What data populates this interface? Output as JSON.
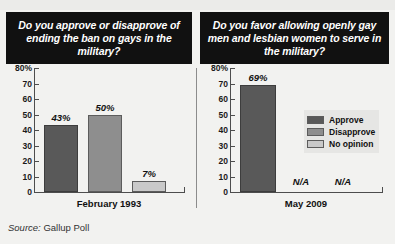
{
  "chart_data": [
    {
      "type": "bar",
      "title": "Do you approve or disapprove of ending the ban on gays in the military?",
      "xlabel": "February 1993",
      "ylabel": "",
      "categories": [
        "Approve",
        "Disapprove",
        "No opinion"
      ],
      "values": [
        43,
        50,
        7
      ],
      "value_labels": [
        "43%",
        "50%",
        "7%"
      ],
      "ylim": [
        0,
        80
      ],
      "yticks": [
        "80%",
        "70",
        "60",
        "50",
        "40",
        "30",
        "20",
        "10",
        "0"
      ],
      "ytick_values": [
        80,
        70,
        60,
        50,
        40,
        30,
        20,
        10,
        0
      ],
      "grid": false,
      "legend_position": "none"
    },
    {
      "type": "bar",
      "title": "Do you favor allowing openly gay men and lesbian women to serve in the military?",
      "xlabel": "May 2009",
      "ylabel": "",
      "categories": [
        "Approve",
        "Disapprove",
        "No opinion"
      ],
      "values": [
        69,
        null,
        null
      ],
      "value_labels": [
        "69%",
        "N/A",
        "N/A"
      ],
      "ylim": [
        0,
        80
      ],
      "yticks": [
        "80%",
        "70",
        "60",
        "50",
        "40",
        "30",
        "20",
        "10",
        "0"
      ],
      "ytick_values": [
        80,
        70,
        60,
        50,
        40,
        30,
        20,
        10,
        0
      ],
      "grid": false,
      "legend_position": "right",
      "legend": [
        {
          "label": "Approve",
          "color": "#595959"
        },
        {
          "label": "Disapprove",
          "color": "#8e8e8e"
        },
        {
          "label": "No opinion",
          "color": "#c9c9c9"
        }
      ]
    }
  ],
  "headers": {
    "left": "Do you approve or disapprove of ending the ban on gays in the military?",
    "right": "Do you favor allowing openly gay men and lesbian women to serve in the military?"
  },
  "source": {
    "label": "Source:",
    "value": "Gallup Poll"
  },
  "colors": {
    "approve": "#595959",
    "disapprove": "#8e8e8e",
    "no_opinion": "#c9c9c9",
    "header_background": "#111111",
    "page_background": "#f2f2f0"
  }
}
